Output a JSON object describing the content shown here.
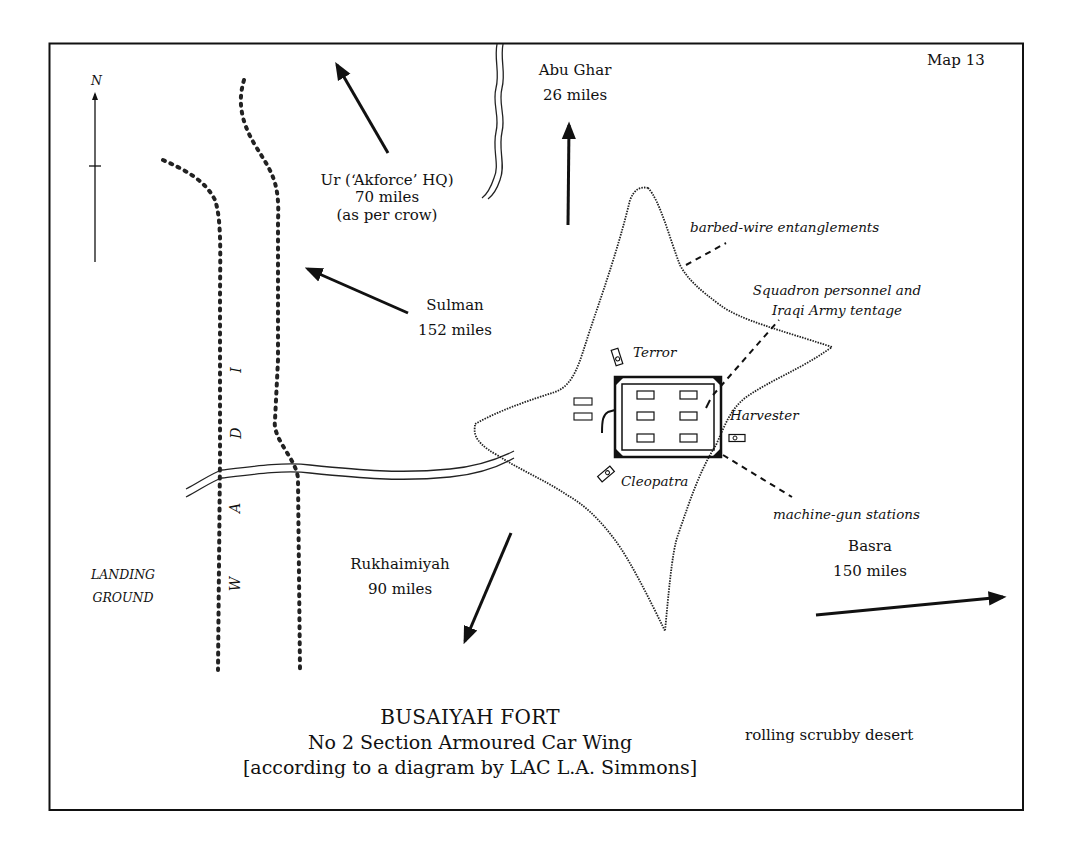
{
  "map": {
    "number_label": "Map 13",
    "north_label": "N",
    "title": "BUSAIYAH FORT",
    "subtitle": "No 2 Section Armoured Car Wing",
    "attribution": "[according to a diagram by LAC L.A. Simmons]",
    "colors": {
      "ink": "#111111",
      "background": "#ffffff"
    }
  },
  "destinations": [
    {
      "id": "ur",
      "name": "Ur (‘Akforce’ HQ)",
      "distance": "70 miles",
      "note": "(as per crow)",
      "direction": "north-west"
    },
    {
      "id": "abu-ghar",
      "name": "Abu Ghar",
      "distance": "26 miles",
      "direction": "north"
    },
    {
      "id": "sulman",
      "name": "Sulman",
      "distance": "152 miles",
      "direction": "west-north-west"
    },
    {
      "id": "rukhaimiyah",
      "name": "Rukhaimiyah",
      "distance": "90 miles",
      "direction": "south-south-west"
    },
    {
      "id": "basra",
      "name": "Basra",
      "distance": "150 miles",
      "direction": "east"
    }
  ],
  "annotations": {
    "barbed_wire": "barbed-wire entanglements",
    "tentage_line1": "Squadron personnel and",
    "tentage_line2": "Iraqi Army tentage",
    "machine_guns": "machine-gun stations"
  },
  "vehicles": [
    {
      "name": "Terror"
    },
    {
      "name": "Harvester"
    },
    {
      "name": "Cleopatra"
    }
  ],
  "wireless": [
    {
      "label": "W/T"
    },
    {
      "label": "W/T"
    }
  ],
  "wadi_letters": [
    "W",
    "A",
    "D",
    "I"
  ],
  "terrain": {
    "landing_line1": "LANDING",
    "landing_line2": "GROUND",
    "desert": "rolling scrubby desert"
  }
}
